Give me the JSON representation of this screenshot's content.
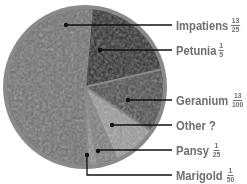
{
  "chart_data": {
    "type": "pie",
    "title": "",
    "center": [
      85,
      87
    ],
    "radius": 82,
    "start_angle_deg": 5,
    "slices": [
      {
        "label": "Petunia",
        "fraction": "1/5",
        "value": 0.2,
        "fill": "#2b2b2b",
        "texture": "#3d3d3d"
      },
      {
        "label": "Geranium",
        "fraction": "13/100",
        "value": 0.13,
        "fill": "#4a4a4a",
        "texture": "#5a5a5a"
      },
      {
        "label": "Other",
        "fraction": "?",
        "value": 0.09,
        "fill": "#9a9a9a",
        "texture": "#d8d8d8"
      },
      {
        "label": "Pansy",
        "fraction": "1/25",
        "value": 0.04,
        "fill": "#7a7a7a",
        "texture": "#b0b0b0"
      },
      {
        "label": "Marigold",
        "fraction": "1/50",
        "value": 0.02,
        "fill": "#8c8c8c",
        "texture": "#c4c4c4"
      },
      {
        "label": "Impatiens",
        "fraction": "13/25",
        "value": 0.52,
        "fill": "#6e6e6e",
        "texture": "#a8a8a8"
      }
    ],
    "legend_position": "right",
    "rim_color": "#8a8a8a"
  },
  "labels": [
    {
      "name": "Impatiens",
      "num": "13",
      "den": "25",
      "y": 25,
      "dot": [
        66,
        25
      ]
    },
    {
      "name": "Petunia",
      "num": "1",
      "den": "5",
      "y": 50,
      "dot": [
        100,
        50
      ]
    },
    {
      "name": "Geranium",
      "num": "13",
      "den": "100",
      "y": 100,
      "dot": [
        128,
        100
      ]
    },
    {
      "name": "Other ?",
      "num": "",
      "den": "",
      "y": 125,
      "dot": [
        112,
        125
      ]
    },
    {
      "name": "Pansy",
      "num": "1",
      "den": "25",
      "y": 150,
      "dot": [
        98,
        151
      ]
    },
    {
      "name": "Marigold",
      "num": "1",
      "den": "50",
      "y": 175,
      "dot": [
        87,
        155
      ]
    }
  ]
}
